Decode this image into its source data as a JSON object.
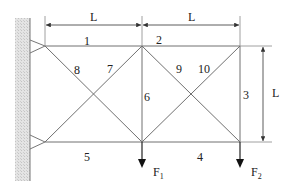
{
  "diagram": {
    "type": "truss",
    "dimensions": {
      "top_left_span": "L",
      "top_right_span": "L",
      "right_height": "L"
    },
    "members": [
      {
        "id": "1",
        "label": "1"
      },
      {
        "id": "2",
        "label": "2"
      },
      {
        "id": "3",
        "label": "3"
      },
      {
        "id": "4",
        "label": "4"
      },
      {
        "id": "5",
        "label": "5"
      },
      {
        "id": "6",
        "label": "6"
      },
      {
        "id": "7",
        "label": "7"
      },
      {
        "id": "8",
        "label": "8"
      },
      {
        "id": "9",
        "label": "9"
      },
      {
        "id": "10",
        "label": "10"
      }
    ],
    "loads": [
      {
        "name": "F",
        "sub": "1"
      },
      {
        "name": "F",
        "sub": "2"
      }
    ],
    "colors": {
      "line": "#6a6a6a",
      "wall": "#d8d8d8",
      "arrow": "#111111"
    }
  }
}
